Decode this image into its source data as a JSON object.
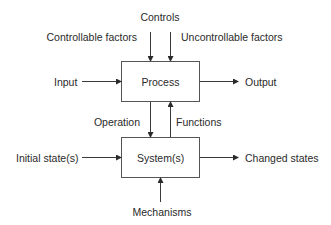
{
  "diagram": {
    "top_label": "Controls",
    "left_top_label": "Controllable factors",
    "right_top_label": "Uncontrollable factors",
    "process_box": "Process",
    "input_label": "Input",
    "output_label": "Output",
    "operation_label": "Operation",
    "functions_label": "Functions",
    "system_box": "System(s)",
    "initial_label": "Initial state(s)",
    "changed_label": "Changed states",
    "mechanisms_label": "Mechanisms"
  }
}
